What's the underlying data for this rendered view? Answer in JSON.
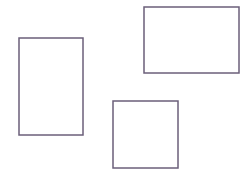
{
  "canvas": {
    "width": 250,
    "height": 180,
    "background_color": "#ffffff"
  },
  "style": {
    "stroke_color": "#6b5f7a",
    "stroke_width": 1.5,
    "fill": "none"
  },
  "shapes": [
    {
      "name": "rectangle-left",
      "type": "rectangle",
      "orientation": "portrait",
      "x": 19,
      "y": 38,
      "width": 64,
      "height": 97,
      "stroke_color": "#6b5f7a",
      "fill": "none"
    },
    {
      "name": "rectangle-top-right",
      "type": "rectangle",
      "orientation": "landscape",
      "x": 144,
      "y": 7,
      "width": 95,
      "height": 66,
      "stroke_color": "#6b5f7a",
      "fill": "none"
    },
    {
      "name": "square-bottom-center",
      "type": "square",
      "orientation": "square",
      "x": 113,
      "y": 101,
      "width": 65,
      "height": 67,
      "stroke_color": "#6b5f7a",
      "fill": "none"
    }
  ]
}
